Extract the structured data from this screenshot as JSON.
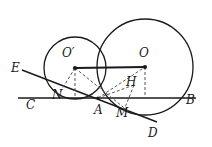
{
  "figure": {
    "type": "geometry-diagram",
    "stroke_color": "#1a1a1a",
    "dash_color": "#4d4d4d",
    "background": "#ffffff",
    "width": 212,
    "height": 147
  },
  "labels": [
    {
      "id": "O-prime",
      "text": "O′",
      "x": 62,
      "y": 47
    },
    {
      "id": "O",
      "text": "O",
      "x": 139,
      "y": 47
    },
    {
      "id": "E",
      "text": "E",
      "x": 11,
      "y": 62
    },
    {
      "id": "H",
      "text": "H",
      "x": 126,
      "y": 76
    },
    {
      "id": "N",
      "text": "N",
      "x": 52,
      "y": 89
    },
    {
      "id": "C",
      "text": "C",
      "x": 26,
      "y": 99
    },
    {
      "id": "A",
      "text": "A",
      "x": 94,
      "y": 104
    },
    {
      "id": "M",
      "text": "M",
      "x": 116,
      "y": 107
    },
    {
      "id": "B",
      "text": "B",
      "x": 186,
      "y": 94
    },
    {
      "id": "D",
      "text": "D",
      "x": 148,
      "y": 127
    }
  ],
  "circles": [
    {
      "id": "circle-O-prime",
      "cx": 75,
      "cy": 68,
      "r": 31
    },
    {
      "id": "circle-O",
      "cx": 145,
      "cy": 67,
      "r": 48
    }
  ],
  "points": [
    {
      "id": "center-O-prime",
      "x": 75,
      "y": 68
    },
    {
      "id": "center-O",
      "x": 145,
      "y": 67
    },
    {
      "id": "point-A",
      "x": 98,
      "y": 98
    }
  ],
  "solid_segments": [
    {
      "id": "segment-CB",
      "x1": 18,
      "y1": 98,
      "x2": 196,
      "y2": 98
    },
    {
      "id": "segment-OprimeO",
      "x1": 75,
      "y1": 68,
      "x2": 145,
      "y2": 67
    },
    {
      "id": "segment-EAD",
      "x1": 22,
      "y1": 70,
      "x2": 157,
      "y2": 122
    }
  ],
  "dashed_segments": [
    {
      "id": "segment-Oprime-N-foot",
      "x1": 75,
      "y1": 68,
      "x2": 57,
      "y2": 97
    },
    {
      "id": "segment-Oprime-vertical",
      "x1": 75,
      "y1": 68,
      "x2": 75,
      "y2": 98
    },
    {
      "id": "segment-O-vertical",
      "x1": 145,
      "y1": 67,
      "x2": 145,
      "y2": 98
    },
    {
      "id": "segment-A-O",
      "x1": 98,
      "y1": 98,
      "x2": 145,
      "y2": 67
    },
    {
      "id": "segment-Oprime-M",
      "x1": 75,
      "y1": 68,
      "x2": 127,
      "y2": 110
    },
    {
      "id": "segment-H-M",
      "x1": 133,
      "y1": 86,
      "x2": 124,
      "y2": 109
    },
    {
      "id": "segment-A-M-foot",
      "x1": 98,
      "y1": 98,
      "x2": 133,
      "y2": 86
    }
  ]
}
